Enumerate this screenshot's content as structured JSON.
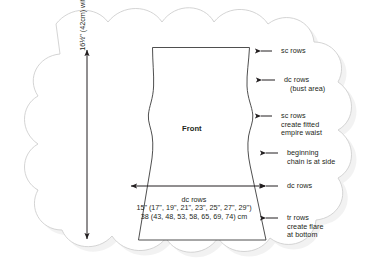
{
  "diagram": {
    "title_piece": "Front",
    "vertical_dimension": "16½\" (42cm) without straps (all sizes)",
    "width_callout": {
      "rows_label": "dc rows",
      "inches": "15\" (17\", 19\", 21\", 23\", 25\", 27\", 29\")",
      "centimeters": "38 (43, 48, 53, 58, 65, 69, 74) cm"
    },
    "annotations": [
      {
        "id": "annotation-sc-rows-top",
        "lines": [
          "sc rows"
        ]
      },
      {
        "id": "annotation-dc-rows-bust",
        "lines": [
          "dc rows",
          "(bust area)"
        ]
      },
      {
        "id": "annotation-sc-rows-waist",
        "lines": [
          "sc rows",
          "create fitted",
          "empire waist"
        ]
      },
      {
        "id": "annotation-beginning-chain",
        "lines": [
          "beginning",
          "chain is at side"
        ]
      },
      {
        "id": "annotation-dc-rows-skirt",
        "lines": [
          "dc rows"
        ]
      },
      {
        "id": "annotation-tr-rows-flare",
        "lines": [
          "tr rows",
          "create flare",
          "at bottom"
        ]
      }
    ],
    "colors": {
      "ink": "#231f20",
      "garment_outline": "#3b3b3b",
      "frame_outline": "#cfcfcf",
      "frame_shadow": "#e8e8e8",
      "background": "#ffffff"
    }
  }
}
